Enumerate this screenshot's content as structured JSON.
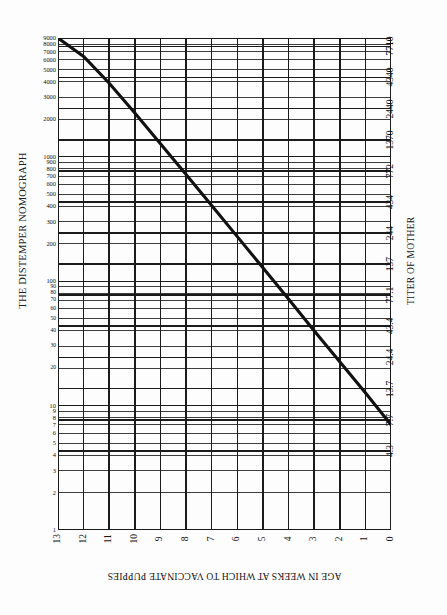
{
  "title": "THE DISTEMPER NOMOGRAPH",
  "axes": {
    "left_title": "",
    "right_title": "TITER OF MOTHER",
    "bottom_title": "AGE IN WEEKS AT WHICH TO VACCINATE PUPPIES"
  },
  "chart_data": {
    "type": "line",
    "title": "THE DISTEMPER NOMOGRAPH",
    "xlabel": "AGE IN WEEKS AT WHICH TO VACCINATE PUPPIES",
    "ylabel": "",
    "y2label": "TITER OF MOTHER",
    "grid": true,
    "legend": null,
    "x_axis": {
      "orientation": "bottom",
      "scale": "linear",
      "reversed": true,
      "range": [
        13,
        0
      ],
      "ticks": [
        13,
        12,
        11,
        10,
        9,
        8,
        7,
        6,
        5,
        4,
        3,
        2,
        1,
        0
      ],
      "tick_labels": [
        "13",
        "12",
        "11",
        "10",
        "9",
        "8",
        "7",
        "6",
        "5",
        "4",
        "3",
        "2",
        "1",
        "0"
      ]
    },
    "y_axis_left": {
      "scale": "log",
      "range": [
        1,
        9000
      ],
      "major_ticks": [
        9000,
        8000,
        7000,
        6000,
        5000,
        4000,
        3000,
        2000,
        1000,
        900,
        800,
        700,
        600,
        500,
        400,
        300,
        200,
        100,
        90,
        80,
        70,
        60,
        50,
        40,
        30,
        20,
        10,
        9,
        8,
        7,
        6,
        5,
        4,
        3,
        2,
        1
      ],
      "labeled_ticks": [
        {
          "value": 9000,
          "label": "9000"
        },
        {
          "value": 8000,
          "label": "8000"
        },
        {
          "value": 7000,
          "label": "7000"
        },
        {
          "value": 6000,
          "label": "6000"
        },
        {
          "value": 5000,
          "label": "5000"
        },
        {
          "value": 4000,
          "label": "4000"
        },
        {
          "value": 3000,
          "label": "3000"
        },
        {
          "value": 2000,
          "label": "2000"
        },
        {
          "value": 1000,
          "label": "1000"
        },
        {
          "value": 900,
          "label": "900"
        },
        {
          "value": 800,
          "label": "800"
        },
        {
          "value": 700,
          "label": "700"
        },
        {
          "value": 600,
          "label": "600"
        },
        {
          "value": 500,
          "label": "500"
        },
        {
          "value": 400,
          "label": "400"
        },
        {
          "value": 300,
          "label": "300"
        },
        {
          "value": 200,
          "label": "200"
        },
        {
          "value": 100,
          "label": "100"
        },
        {
          "value": 90,
          "label": "90"
        },
        {
          "value": 80,
          "label": "80"
        },
        {
          "value": 70,
          "label": "70"
        },
        {
          "value": 60,
          "label": "60"
        },
        {
          "value": 50,
          "label": "50"
        },
        {
          "value": 40,
          "label": "40"
        },
        {
          "value": 30,
          "label": "30"
        },
        {
          "value": 20,
          "label": "20"
        },
        {
          "value": 10,
          "label": "10"
        },
        {
          "value": 9,
          "label": "9"
        },
        {
          "value": 8,
          "label": "8"
        },
        {
          "value": 7,
          "label": "7"
        },
        {
          "value": 6,
          "label": "6"
        },
        {
          "value": 5,
          "label": "5"
        },
        {
          "value": 4,
          "label": "4"
        },
        {
          "value": 3,
          "label": "3"
        },
        {
          "value": 2,
          "label": "2"
        },
        {
          "value": 1,
          "label": "1"
        }
      ]
    },
    "y_axis_right": {
      "scale": "log",
      "labeled_ticks": [
        {
          "value": 7710,
          "label": "7710"
        },
        {
          "value": 4340,
          "label": "4340"
        },
        {
          "value": 2440,
          "label": "2440"
        },
        {
          "value": 1370,
          "label": "1370"
        },
        {
          "value": 772,
          "label": "772"
        },
        {
          "value": 434,
          "label": "434"
        },
        {
          "value": 244,
          "label": "244"
        },
        {
          "value": 137,
          "label": "137"
        },
        {
          "value": 77.1,
          "label": "77.1"
        },
        {
          "value": 43.4,
          "label": "43.4"
        },
        {
          "value": 24.4,
          "label": "24.4"
        },
        {
          "value": 13.7,
          "label": "13.7"
        },
        {
          "value": 7.7,
          "label": "7.7"
        },
        {
          "value": 4.3,
          "label": "4.3"
        }
      ]
    },
    "series": [
      {
        "name": "nomograph-line",
        "style": "solid-bold",
        "color": "#111111",
        "description": "Diagonal nomograph reading line: maternal titer vs recommended vaccination week",
        "points": [
          {
            "x": 13.0,
            "y": 9000
          },
          {
            "x": 12.0,
            "y": 6400
          },
          {
            "x": 11.0,
            "y": 3900
          },
          {
            "x": 10.0,
            "y": 2250
          },
          {
            "x": 9.0,
            "y": 1270
          },
          {
            "x": 8.0,
            "y": 720
          },
          {
            "x": 7.0,
            "y": 405
          },
          {
            "x": 6.0,
            "y": 228
          },
          {
            "x": 5.0,
            "y": 128
          },
          {
            "x": 4.0,
            "y": 72
          },
          {
            "x": 3.0,
            "y": 40
          },
          {
            "x": 2.0,
            "y": 22.5
          },
          {
            "x": 1.0,
            "y": 12.7
          },
          {
            "x": 0.0,
            "y": 7.0
          }
        ]
      }
    ]
  }
}
